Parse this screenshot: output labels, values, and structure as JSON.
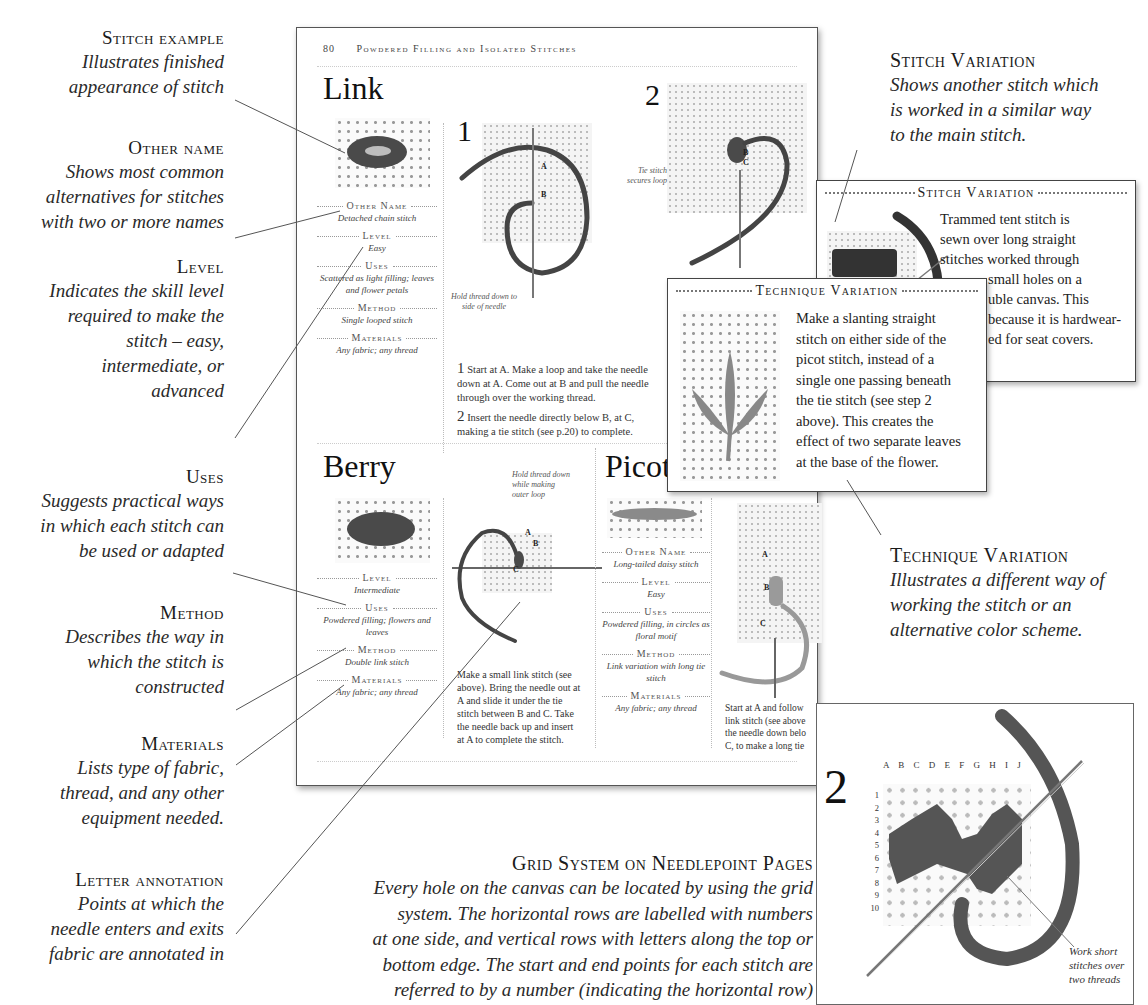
{
  "left_annotations": [
    {
      "heading": "Stitch example",
      "desc": [
        "Illustrates finished",
        "appearance of stitch"
      ]
    },
    {
      "heading": "Other name",
      "desc": [
        "Shows most common",
        "alternatives for stitches",
        "with two or more names"
      ]
    },
    {
      "heading": "Level",
      "desc": [
        "Indicates the skill level",
        "required to make the",
        "stitch – easy,",
        "intermediate, or",
        "advanced"
      ]
    },
    {
      "heading": "Uses",
      "desc": [
        "Suggests practical ways",
        "in which each stitch can",
        "be used or adapted"
      ]
    },
    {
      "heading": "Method",
      "desc": [
        "Describes the way in",
        "which the stitch is",
        "constructed"
      ]
    },
    {
      "heading": "Materials",
      "desc": [
        "Lists type of fabric,",
        "thread, and any other",
        "equipment needed."
      ]
    },
    {
      "heading": "Letter annotation",
      "desc": [
        "Points at which the",
        "needle enters and exits",
        "fabric are annotated in"
      ]
    }
  ],
  "right_annotations": {
    "stitch_variation": {
      "heading": "Stitch Variation",
      "desc": [
        "Shows another stitch which",
        "is worked in a similar way",
        "to the main stitch."
      ]
    },
    "technique_variation": {
      "heading": "Technique Variation",
      "desc": [
        "Illustrates a different way of",
        "working the stitch or an",
        "alternative color scheme."
      ]
    }
  },
  "page": {
    "page_number": "80",
    "running_head": "Powdered Filling and Isolated Stitches",
    "link": {
      "title": "Link",
      "info": [
        {
          "label": "Other Name",
          "value": "Detached chain stitch"
        },
        {
          "label": "Level",
          "value": "Easy"
        },
        {
          "label": "Uses",
          "value": "Scattered as light filling; leaves and flower petals"
        },
        {
          "label": "Method",
          "value": "Single looped stitch"
        },
        {
          "label": "Materials",
          "value": "Any fabric; any thread"
        }
      ],
      "step1_number": "1",
      "step2_number": "2",
      "step1_labels": [
        "A",
        "B"
      ],
      "step2_labels": [
        "B",
        "C"
      ],
      "callout_hold": "Hold thread down to side of needle",
      "callout_tie": "Tie stitch secures loop",
      "instructions": [
        {
          "num": "1",
          "text": "Start at A. Make a loop and take the needle down at A. Come out at B and pull the needle through over the working thread."
        },
        {
          "num": "2",
          "text": "Insert the needle directly below B, at C, making a tie stitch (see p.20) to complete."
        }
      ]
    },
    "berry": {
      "title": "Berry",
      "info": [
        {
          "label": "Level",
          "value": "Intermediate"
        },
        {
          "label": "Uses",
          "value": "Powdered filling; flowers and leaves"
        },
        {
          "label": "Method",
          "value": "Double link stitch"
        },
        {
          "label": "Materials",
          "value": "Any fabric; any thread"
        }
      ],
      "callout": "Hold thread down while making outer loop",
      "labels": [
        "A",
        "B",
        "C"
      ],
      "instructions": "Make a small link stitch (see above). Bring the needle out at A and slide it under the tie stitch between B and C. Take the needle back up and insert at A to complete the stitch."
    },
    "picot": {
      "title": "Picot",
      "info": [
        {
          "label": "Other Name",
          "value": "Long-tailed daisy stitch"
        },
        {
          "label": "Level",
          "value": "Easy"
        },
        {
          "label": "Uses",
          "value": "Powdered filling, in circles as floral motif"
        },
        {
          "label": "Method",
          "value": "Link variation with long tie stitch"
        },
        {
          "label": "Materials",
          "value": "Any fabric; any thread"
        }
      ],
      "labels": [
        "A",
        "B",
        "C"
      ],
      "instructions": "Start at A and follow link stitch (see above the needle down belo C, to make a long tie"
    }
  },
  "stitch_variation_box": {
    "title": "Stitch Variation",
    "body": [
      "Trammed tent stitch is",
      "sewn over long straight",
      "stitches worked through",
      "small holes on a",
      "uble canvas. This",
      "because it is hardwear-",
      "ed for seat covers."
    ]
  },
  "technique_variation_box": {
    "title": "Technique Variation",
    "body": [
      "Make a slanting straight",
      "stitch on either side of the",
      "picot stitch, instead of a",
      "single one passing beneath",
      "the tie stitch (see step 2",
      "above). This creates the",
      "effect of two separate leaves",
      "at the base of the flower."
    ]
  },
  "grid_caption": {
    "heading": "Grid System on Needlepoint Pages",
    "desc": [
      "Every hole on the canvas can be located by using the grid",
      "system. The horizontal rows are labelled with numbers",
      "at one side, and vertical rows with letters along the top or",
      "bottom edge. The start and end points for each stitch are",
      "referred to by a number (indicating the horizontal row)"
    ]
  },
  "needlepoint_inset": {
    "step_number": "2",
    "column_letters": "A B C D E F G H I J",
    "row_numbers": [
      "1",
      "2",
      "3",
      "4",
      "5",
      "6",
      "7",
      "8",
      "9",
      "10"
    ],
    "callout": [
      "Work short",
      "stitches over",
      "two threads"
    ]
  }
}
